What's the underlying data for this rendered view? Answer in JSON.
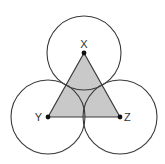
{
  "diagram": {
    "type": "geometry",
    "colors": {
      "background": "#ffffff",
      "stroke": "#3a3a3a",
      "triangle_fill": "#c9c9c9",
      "point": "#111111",
      "label": "#333333"
    },
    "points": [
      {
        "name": "X",
        "label": "X",
        "x": 84,
        "y": 53
      },
      {
        "name": "Y",
        "label": "Y",
        "x": 48,
        "y": 117
      },
      {
        "name": "Z",
        "label": "Z",
        "x": 120,
        "y": 117
      }
    ],
    "circles": [
      {
        "center": "X",
        "cx": 84,
        "cy": 53,
        "r": 37
      },
      {
        "center": "Y",
        "cx": 48,
        "cy": 117,
        "r": 37
      },
      {
        "center": "Z",
        "cx": 120,
        "cy": 117,
        "r": 37
      }
    ],
    "triangle": {
      "vertices": [
        "X",
        "Y",
        "Z"
      ],
      "shaded": true
    },
    "labels": {
      "x": "X",
      "y": "Y",
      "z": "Z"
    }
  }
}
